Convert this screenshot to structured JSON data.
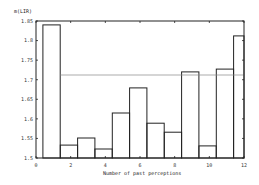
{
  "chart_data": {
    "type": "bar",
    "title": "",
    "xlabel": "Number of past perceptions",
    "ylabel": "m(LIR)",
    "xlim": [
      0,
      12
    ],
    "ylim": [
      1.5,
      1.85
    ],
    "xticks": [
      0,
      2,
      4,
      6,
      8,
      10,
      12
    ],
    "xtick_labels": [
      "0",
      "2",
      "4",
      "6",
      "8",
      "10",
      "12"
    ],
    "yticks": [
      1.5,
      1.55,
      1.6,
      1.65,
      1.7,
      1.75,
      1.8,
      1.85
    ],
    "ytick_labels": [
      "1.5",
      "1.55",
      "1.6",
      "1.65",
      "1.7",
      "1.75",
      "1.8",
      "1.85"
    ],
    "grid": false,
    "legend": null,
    "categories": [
      1,
      2,
      3,
      4,
      5,
      6,
      7,
      8,
      9,
      10,
      11,
      12
    ],
    "values": [
      1.84,
      1.533,
      1.551,
      1.523,
      1.615,
      1.679,
      1.589,
      1.566,
      1.72,
      1.531,
      1.727,
      1.812
    ],
    "bar_fill": "none",
    "bar_edge_color": "#222222",
    "reference_line": {
      "y": 1.712,
      "x_start": 1.5,
      "x_end": 12,
      "color": "#888888"
    }
  }
}
